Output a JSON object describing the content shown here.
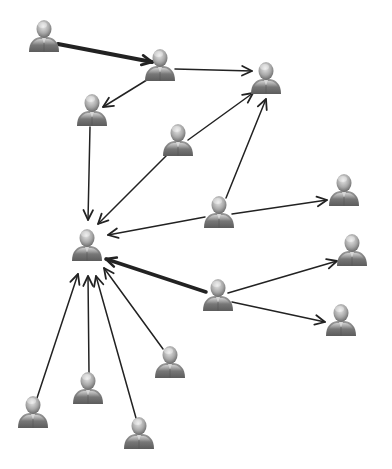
{
  "diagram": {
    "type": "network-graph",
    "colors": {
      "background": "#ffffff",
      "edge": "#222222",
      "person_dark": "#6f6f6f",
      "person_light": "#cfcfcf"
    },
    "nodes": [
      {
        "id": "n1",
        "x": 44,
        "y": 36
      },
      {
        "id": "n2",
        "x": 160,
        "y": 65
      },
      {
        "id": "n3",
        "x": 266,
        "y": 78
      },
      {
        "id": "n4",
        "x": 92,
        "y": 110
      },
      {
        "id": "n5",
        "x": 178,
        "y": 140
      },
      {
        "id": "n6",
        "x": 219,
        "y": 212
      },
      {
        "id": "n7",
        "x": 344,
        "y": 190
      },
      {
        "id": "n8",
        "x": 87,
        "y": 245
      },
      {
        "id": "n9",
        "x": 352,
        "y": 250
      },
      {
        "id": "n10",
        "x": 218,
        "y": 295
      },
      {
        "id": "n11",
        "x": 341,
        "y": 320
      },
      {
        "id": "n12",
        "x": 170,
        "y": 362
      },
      {
        "id": "n13",
        "x": 88,
        "y": 388
      },
      {
        "id": "n14",
        "x": 33,
        "y": 412
      },
      {
        "id": "n15",
        "x": 139,
        "y": 433
      }
    ],
    "edges": [
      {
        "from": "n1",
        "to": "n2",
        "weight": 4,
        "x1": 58,
        "y1": 44,
        "x2": 152,
        "y2": 62
      },
      {
        "from": "n2",
        "to": "n3",
        "weight": 1.5,
        "x1": 175,
        "y1": 69,
        "x2": 252,
        "y2": 71
      },
      {
        "from": "n2",
        "to": "n4",
        "weight": 1.5,
        "x1": 150,
        "y1": 78,
        "x2": 103,
        "y2": 107
      },
      {
        "from": "n4",
        "to": "n8",
        "weight": 1.5,
        "x1": 90,
        "y1": 127,
        "x2": 88,
        "y2": 220
      },
      {
        "from": "n5",
        "to": "n3",
        "weight": 1.5,
        "x1": 188,
        "y1": 140,
        "x2": 253,
        "y2": 93
      },
      {
        "from": "n5",
        "to": "n8",
        "weight": 1.5,
        "x1": 167,
        "y1": 155,
        "x2": 98,
        "y2": 224
      },
      {
        "from": "n6",
        "to": "n3",
        "weight": 1.5,
        "x1": 226,
        "y1": 198,
        "x2": 266,
        "y2": 99
      },
      {
        "from": "n6",
        "to": "n7",
        "weight": 1.5,
        "x1": 232,
        "y1": 214,
        "x2": 327,
        "y2": 200
      },
      {
        "from": "n6",
        "to": "n8",
        "weight": 1.5,
        "x1": 205,
        "y1": 217,
        "x2": 108,
        "y2": 235
      },
      {
        "from": "n10",
        "to": "n8",
        "weight": 3.5,
        "x1": 206,
        "y1": 292,
        "x2": 106,
        "y2": 259
      },
      {
        "from": "n10",
        "to": "n9",
        "weight": 1.5,
        "x1": 228,
        "y1": 293,
        "x2": 337,
        "y2": 261
      },
      {
        "from": "n10",
        "to": "n11",
        "weight": 1.5,
        "x1": 232,
        "y1": 302,
        "x2": 325,
        "y2": 322
      },
      {
        "from": "n12",
        "to": "n8",
        "weight": 1.5,
        "x1": 163,
        "y1": 349,
        "x2": 104,
        "y2": 268
      },
      {
        "from": "n13",
        "to": "n8",
        "weight": 1.5,
        "x1": 89,
        "y1": 373,
        "x2": 88,
        "y2": 276
      },
      {
        "from": "n14",
        "to": "n8",
        "weight": 1.5,
        "x1": 37,
        "y1": 398,
        "x2": 78,
        "y2": 274
      },
      {
        "from": "n15",
        "to": "n8",
        "weight": 1.5,
        "x1": 136,
        "y1": 418,
        "x2": 96,
        "y2": 276
      }
    ]
  }
}
